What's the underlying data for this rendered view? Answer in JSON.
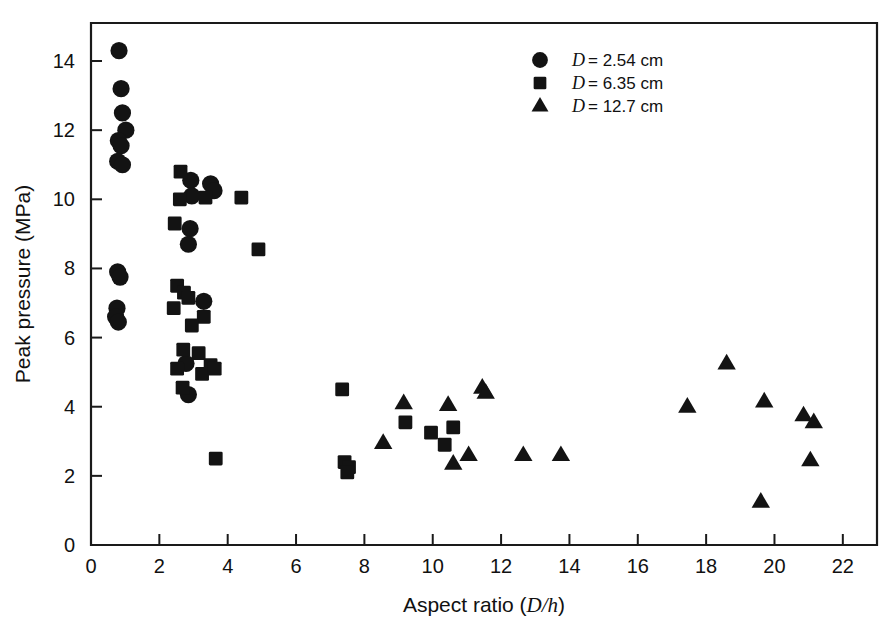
{
  "chart_data": {
    "type": "scatter",
    "title": "",
    "xlabel": "Aspect ratio (D/h)",
    "xlabel_plain": "Aspect ratio (",
    "xlabel_italic": "D/h",
    "xlabel_close": ")",
    "ylabel": "Peak pressure (MPa)",
    "xlim": [
      0,
      23
    ],
    "ylim": [
      0,
      15.1
    ],
    "xticks": [
      0,
      2,
      4,
      6,
      8,
      10,
      12,
      14,
      16,
      18,
      20,
      22
    ],
    "yticks": [
      0,
      2,
      4,
      6,
      8,
      10,
      12,
      14
    ],
    "xtick_labels": [
      "0",
      "2",
      "4",
      "6",
      "8",
      "10",
      "12",
      "14",
      "16",
      "18",
      "20",
      "22"
    ],
    "ytick_labels": [
      "0",
      "2",
      "4",
      "6",
      "8",
      "10",
      "12",
      "14"
    ],
    "grid": false,
    "legend_position": "upper-right",
    "marker_color": "#131313",
    "axis_color": "#1a1a1a",
    "background_color": "#ffffff",
    "series": [
      {
        "name": "D = 2.54 cm",
        "label_italic": "D",
        "label_rest": "= 2.54 cm",
        "marker": "circle",
        "points": [
          [
            0.82,
            14.3
          ],
          [
            0.88,
            13.2
          ],
          [
            0.92,
            12.5
          ],
          [
            1.02,
            12.0
          ],
          [
            0.8,
            11.7
          ],
          [
            0.88,
            11.55
          ],
          [
            0.78,
            11.1
          ],
          [
            0.92,
            11.0
          ],
          [
            0.78,
            7.9
          ],
          [
            0.85,
            7.75
          ],
          [
            0.76,
            6.85
          ],
          [
            0.72,
            6.6
          ],
          [
            0.8,
            6.45
          ],
          [
            2.92,
            10.55
          ],
          [
            2.95,
            10.1
          ],
          [
            3.5,
            10.45
          ],
          [
            3.6,
            10.25
          ],
          [
            2.9,
            9.15
          ],
          [
            2.85,
            8.7
          ],
          [
            3.3,
            7.05
          ],
          [
            2.78,
            5.25
          ],
          [
            2.85,
            4.35
          ]
        ]
      },
      {
        "name": "D = 6.35 cm",
        "label_italic": "D",
        "label_rest": "= 6.35 cm",
        "marker": "square",
        "points": [
          [
            2.62,
            10.8
          ],
          [
            2.6,
            10.0
          ],
          [
            2.45,
            9.3
          ],
          [
            3.35,
            10.05
          ],
          [
            4.4,
            10.05
          ],
          [
            4.9,
            8.55
          ],
          [
            2.52,
            7.5
          ],
          [
            2.72,
            7.3
          ],
          [
            2.42,
            6.85
          ],
          [
            2.85,
            7.15
          ],
          [
            3.3,
            6.6
          ],
          [
            2.95,
            6.35
          ],
          [
            2.7,
            5.65
          ],
          [
            3.15,
            5.55
          ],
          [
            3.5,
            5.2
          ],
          [
            3.25,
            4.95
          ],
          [
            2.52,
            5.1
          ],
          [
            2.68,
            4.55
          ],
          [
            3.62,
            5.1
          ],
          [
            3.65,
            2.5
          ],
          [
            7.35,
            4.5
          ],
          [
            7.42,
            2.4
          ],
          [
            7.55,
            2.25
          ],
          [
            7.5,
            2.1
          ],
          [
            9.2,
            3.55
          ],
          [
            9.95,
            3.25
          ],
          [
            10.35,
            2.9
          ],
          [
            10.6,
            3.4
          ]
        ]
      },
      {
        "name": "D = 12.7 cm",
        "label_italic": "D",
        "label_rest": "= 12.7 cm",
        "marker": "triangle",
        "points": [
          [
            8.55,
            2.95
          ],
          [
            9.15,
            4.1
          ],
          [
            10.45,
            4.05
          ],
          [
            10.6,
            2.35
          ],
          [
            11.05,
            2.6
          ],
          [
            11.45,
            4.55
          ],
          [
            11.55,
            4.4
          ],
          [
            12.65,
            2.6
          ],
          [
            13.75,
            2.6
          ],
          [
            17.45,
            4.0
          ],
          [
            18.6,
            5.25
          ],
          [
            19.6,
            1.25
          ],
          [
            19.7,
            4.15
          ],
          [
            20.85,
            3.75
          ],
          [
            21.15,
            3.55
          ],
          [
            21.05,
            2.45
          ]
        ]
      }
    ]
  },
  "legend": {
    "entries": [
      {
        "marker": "circle",
        "italic": "D",
        "text": "= 2.54 cm"
      },
      {
        "marker": "square",
        "italic": "D",
        "text": "= 6.35 cm"
      },
      {
        "marker": "triangle",
        "italic": "D",
        "text": "= 12.7 cm"
      }
    ]
  }
}
